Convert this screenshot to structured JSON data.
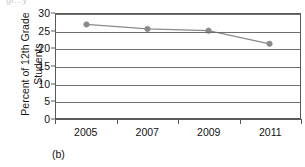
{
  "figure": {
    "caption": "(b)",
    "cropped_text_above": "gr...y"
  },
  "chart_data": {
    "type": "line",
    "title": "",
    "xlabel": "",
    "ylabel": "Percent of 12th Grade Students",
    "ylabel_lines": [
      "Percent of 12th Grade",
      "Students"
    ],
    "categories": [
      "2005",
      "2007",
      "2009",
      "2011"
    ],
    "values": [
      27.0,
      25.7,
      25.2,
      21.4
    ],
    "series": [
      {
        "name": "Percent of 12th Grade Students",
        "values": [
          27.0,
          25.7,
          25.2,
          21.4
        ]
      }
    ],
    "ylim": [
      0,
      30
    ],
    "yticks": [
      30,
      25,
      20,
      15,
      10,
      5,
      0
    ],
    "ytick_labels": [
      "30",
      "25",
      "20",
      "15",
      "10",
      "5",
      "0"
    ],
    "grid": true,
    "grid_axis": "y",
    "legend": false,
    "legend_position": "none",
    "marker": "circle",
    "line_color": "#8a8a8a",
    "marker_color": "#8a8a8a",
    "axis_color": "#5a5a5a",
    "grid_color": "#6e6e6e",
    "background": "#ffffff"
  }
}
